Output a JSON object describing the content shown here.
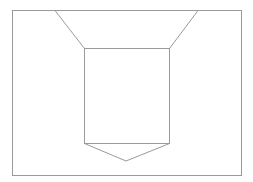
{
  "diagram": {
    "width": 253,
    "height": 182,
    "stroke_color": "#9a9a9a",
    "background": "#ffffff",
    "shapes": {
      "outer_frame": {
        "x": 12,
        "y": 10,
        "width": 229,
        "height": 165
      },
      "inner_box": {
        "x": 84,
        "y": 48,
        "width": 85,
        "height": 95
      },
      "left_top_line": {
        "x1": 55,
        "y1": 10,
        "x2": 84,
        "y2": 48
      },
      "right_top_line": {
        "x1": 198,
        "y1": 10,
        "x2": 169,
        "y2": 48
      },
      "bottom_chevron": {
        "points": "84,143 126,161 169,143"
      }
    }
  }
}
